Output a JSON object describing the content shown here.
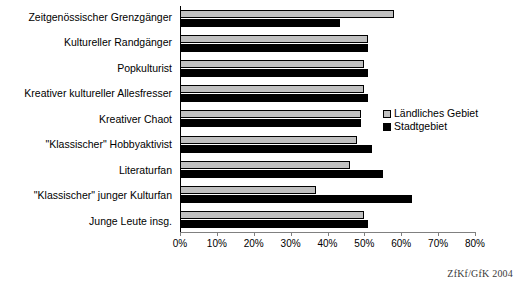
{
  "chart_data": {
    "type": "bar",
    "orientation": "horizontal",
    "title": "",
    "xlabel": "",
    "ylabel": "",
    "xlim": [
      0,
      80
    ],
    "xtick_labels": [
      "0%",
      "10%",
      "20%",
      "30%",
      "40%",
      "50%",
      "60%",
      "70%",
      "80%"
    ],
    "xticks": [
      0,
      10,
      20,
      30,
      40,
      50,
      60,
      70,
      80
    ],
    "grid": false,
    "legend_position": "middle-right",
    "categories": [
      "Zeitgenössischer Grenzgänger",
      "Kultureller  Randgänger",
      "Popkulturist",
      "Kreativer kultureller Allesfresser",
      "Kreativer Chaot",
      "\"Klassischer\" Hobbyaktivist",
      "Literaturfan",
      "\"Klassischer\" junger Kulturfan",
      "Junge Leute insg."
    ],
    "series": [
      {
        "name": "Ländliches Gebiet",
        "color": "#c0c0c0",
        "values": [
          58,
          51,
          50,
          50,
          49,
          48,
          46,
          37,
          50
        ]
      },
      {
        "name": "Stadtgebiet",
        "color": "#000000",
        "values": [
          43.5,
          51,
          51,
          51,
          49,
          52,
          55,
          63,
          51
        ]
      }
    ]
  },
  "source": {
    "text": "ZfKf/GfK 2004"
  }
}
